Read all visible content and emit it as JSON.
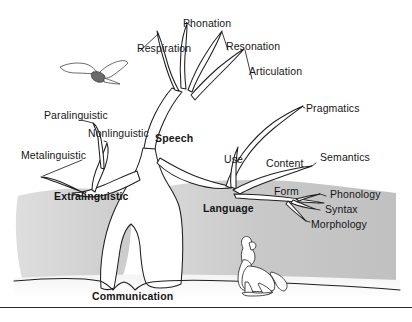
{
  "figure": {
    "background_color": "#ffffff",
    "ink_color": "#1a1a1a",
    "trunk_fill_color": "#c9c9c9",
    "trunk_fill_light": "#dedede",
    "branch_fill_color": "#ffffff"
  },
  "labels": {
    "root": "Communication",
    "speech": "Speech",
    "language": "Language",
    "extralinguistic": "Extralinguistic"
  },
  "speech_branches": [
    {
      "id": "respiration",
      "label": "Respiration"
    },
    {
      "id": "phonation",
      "label": "Phonation"
    },
    {
      "id": "resonation",
      "label": "Resonation"
    },
    {
      "id": "articulation",
      "label": "Articulation"
    }
  ],
  "extralinguistic_branches": [
    {
      "id": "paralinguistic",
      "label": "Paralinguistic"
    },
    {
      "id": "nonlinguistic",
      "label": "Nonlinguistic"
    },
    {
      "id": "metalinguistic",
      "label": "Metalinguistic"
    }
  ],
  "language_branches": [
    {
      "id": "pragmatics",
      "label": "Pragmatics"
    },
    {
      "id": "use",
      "label": "Use"
    },
    {
      "id": "content",
      "label": "Content"
    },
    {
      "id": "semantics",
      "label": "Semantics"
    },
    {
      "id": "form",
      "label": "Form"
    },
    {
      "id": "phonology",
      "label": "Phonology"
    },
    {
      "id": "syntax",
      "label": "Syntax"
    },
    {
      "id": "morphology",
      "label": "Morphology"
    }
  ],
  "illustrations": [
    {
      "id": "bird",
      "name": "bird-in-flight-illustration"
    },
    {
      "id": "dog",
      "name": "howling-dog-illustration"
    }
  ]
}
